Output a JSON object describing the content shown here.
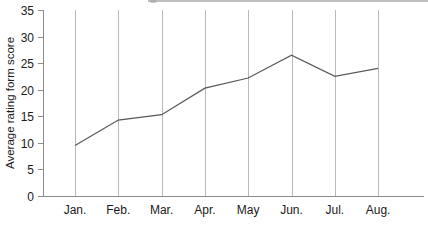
{
  "figure": {
    "background_color": "#ffffff",
    "axis_color": "#8c8c8c",
    "grid_color": "#b9b9b9",
    "line_color": "#59595b",
    "clipped_top_element": ""
  },
  "chart_data": {
    "type": "line",
    "title": "",
    "subtitle": "",
    "xlabel": "",
    "ylabel": "Average rating form score",
    "categories": [
      "Jan.",
      "Feb.",
      "Mar.",
      "Apr.",
      "May",
      "Jun.",
      "Jul.",
      "Aug."
    ],
    "values": [
      9.5,
      14.3,
      15.3,
      20.3,
      22.2,
      26.5,
      22.5,
      24.0
    ],
    "series": [
      {
        "name": "Average rating form score",
        "values": [
          9.5,
          14.3,
          15.3,
          20.3,
          22.2,
          26.5,
          22.5,
          24.0
        ]
      }
    ],
    "ylim": [
      0,
      35
    ],
    "ytick_labels": [
      "0",
      "5",
      "10",
      "15",
      "20",
      "25",
      "30",
      "35"
    ],
    "ytick_values": [
      0,
      5,
      10,
      15,
      20,
      25,
      30,
      35
    ],
    "xtick_labels": [
      "Jan.",
      "Feb.",
      "Mar.",
      "Apr.",
      "May",
      "Jun.",
      "Jul.",
      "Aug."
    ],
    "grid": {
      "vertical": true,
      "horizontal": false
    },
    "legend": {
      "visible": false,
      "position": "none",
      "entries": []
    },
    "annotations": [],
    "markers": false
  }
}
